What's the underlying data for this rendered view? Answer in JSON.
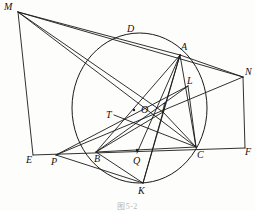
{
  "figure": {
    "type": "euclidean-geometry-diagram",
    "caption": "图5-2",
    "stroke_color": "#1a1a1a",
    "background_color": "#fdfdfb",
    "circle": {
      "label": "circumcircle",
      "cx": 139.5,
      "cy": 108,
      "rx": 67.5,
      "ry": 75
    },
    "points": [
      {
        "id": "M",
        "label": "M",
        "x": 18,
        "y": 12,
        "lx": 4,
        "ly": 2,
        "on_circle": false
      },
      {
        "id": "D",
        "label": "D",
        "x": 132,
        "y": 35,
        "lx": 127,
        "ly": 24,
        "on_circle": true
      },
      {
        "id": "A",
        "label": "A",
        "x": 180,
        "y": 55,
        "lx": 181,
        "ly": 42,
        "on_circle": true
      },
      {
        "id": "N",
        "label": "N",
        "x": 243,
        "y": 77,
        "lx": 245,
        "ly": 67,
        "on_circle": false
      },
      {
        "id": "L",
        "label": "L",
        "x": 188,
        "y": 86,
        "lx": 187,
        "ly": 76,
        "on_circle": false
      },
      {
        "id": "T",
        "label": "T",
        "x": 114,
        "y": 115,
        "lx": 106,
        "ly": 110,
        "on_circle": false
      },
      {
        "id": "O",
        "label": "O",
        "x": 139,
        "y": 110,
        "lx": 141,
        "ly": 105,
        "on_circle": false
      },
      {
        "id": "I",
        "label": "I",
        "x": 163,
        "y": 112,
        "lx": 162,
        "ly": 102,
        "on_circle": false
      },
      {
        "id": "E",
        "label": "E",
        "x": 33,
        "y": 155,
        "lx": 26,
        "ly": 155,
        "on_circle": false
      },
      {
        "id": "P",
        "label": "P",
        "x": 56,
        "y": 155,
        "lx": 51,
        "ly": 157,
        "on_circle": false
      },
      {
        "id": "B",
        "label": "B",
        "x": 96,
        "y": 152,
        "lx": 94,
        "ly": 154,
        "on_circle": true
      },
      {
        "id": "Q",
        "label": "Q",
        "x": 137,
        "y": 153,
        "lx": 133,
        "ly": 156,
        "on_circle": false
      },
      {
        "id": "C",
        "label": "C",
        "x": 196,
        "y": 147,
        "lx": 197,
        "ly": 150,
        "on_circle": true
      },
      {
        "id": "F",
        "label": "F",
        "x": 245,
        "y": 148,
        "lx": 245,
        "ly": 147,
        "on_circle": false
      },
      {
        "id": "K",
        "label": "K",
        "x": 143,
        "y": 183,
        "lx": 138,
        "ly": 186,
        "on_circle": true
      }
    ],
    "segments": [
      {
        "name": "M-E",
        "from": "M",
        "to": "E"
      },
      {
        "name": "M-A",
        "from": "M",
        "to": "A"
      },
      {
        "name": "M-N",
        "from": "M",
        "to": "N"
      },
      {
        "name": "M-I",
        "from": "M",
        "to": "I"
      },
      {
        "name": "M-C",
        "from": "M",
        "to": "C"
      },
      {
        "name": "E-F",
        "from": "E",
        "to": "F"
      },
      {
        "name": "N-F",
        "from": "N",
        "to": "F"
      },
      {
        "name": "A-B",
        "from": "A",
        "to": "B"
      },
      {
        "name": "A-C",
        "from": "A",
        "to": "C"
      },
      {
        "name": "B-C",
        "from": "B",
        "to": "C"
      },
      {
        "name": "A-K",
        "from": "A",
        "to": "K"
      },
      {
        "name": "A-Q",
        "from": "A",
        "to": "Q"
      },
      {
        "name": "A-N",
        "from": "A",
        "to": "N"
      },
      {
        "name": "A-I",
        "from": "A",
        "to": "I"
      },
      {
        "name": "B-I",
        "from": "B",
        "to": "I"
      },
      {
        "name": "C-I",
        "from": "C",
        "to": "I"
      },
      {
        "name": "I-K",
        "from": "I",
        "to": "K"
      },
      {
        "name": "P-N",
        "from": "P",
        "to": "N"
      },
      {
        "name": "P-L",
        "from": "P",
        "to": "L"
      },
      {
        "name": "P-K",
        "from": "P",
        "to": "K"
      },
      {
        "name": "T-C",
        "from": "T",
        "to": "C"
      },
      {
        "name": "B-K",
        "from": "B",
        "to": "K"
      },
      {
        "name": "L-C",
        "from": "L",
        "to": "C"
      },
      {
        "name": "B-L",
        "from": "B",
        "to": "L"
      }
    ],
    "marked_centers": [
      {
        "name": "circle-center-dot",
        "x": 134,
        "y": 110
      },
      {
        "name": "midpoint-dot-Q",
        "x": 137,
        "y": 150
      }
    ]
  }
}
